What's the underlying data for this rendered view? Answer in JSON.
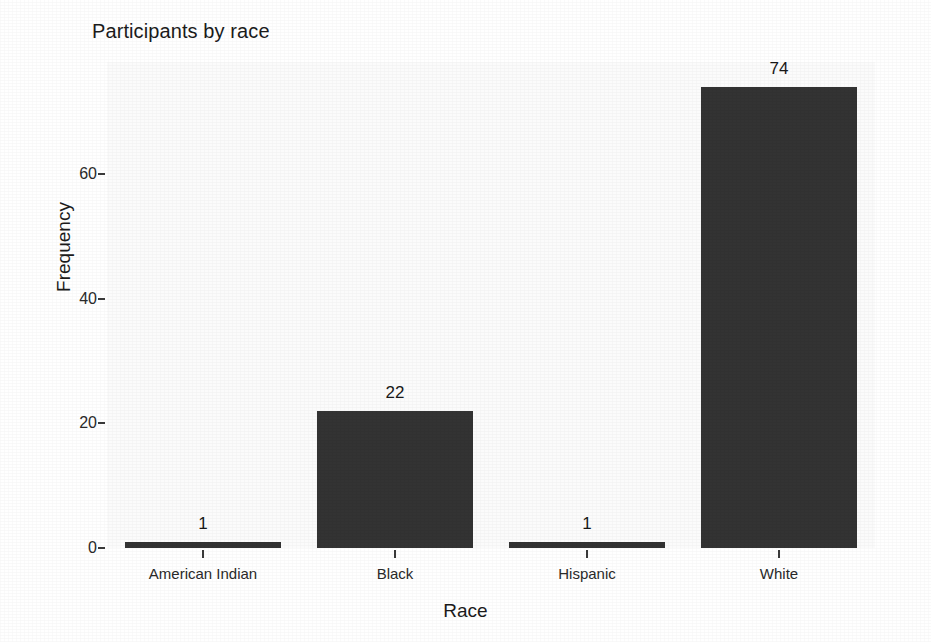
{
  "chart_data": {
    "type": "bar",
    "title": "Participants by race",
    "xlabel": "Race",
    "ylabel": "Frequency",
    "categories": [
      "American Indian",
      "Black",
      "Hispanic",
      "White"
    ],
    "values": [
      1,
      22,
      1,
      74
    ],
    "data_labels": [
      "1",
      "22",
      "1",
      "74"
    ],
    "ylim": [
      0,
      78
    ],
    "yticks": [
      0,
      20,
      40,
      60
    ],
    "ytick_labels": [
      "0",
      "20",
      "40",
      "60"
    ],
    "grid": false,
    "legend": null,
    "bar_color": "#333333",
    "panel_background": "#fbfbfb",
    "text_color": "#1b1b1b"
  }
}
